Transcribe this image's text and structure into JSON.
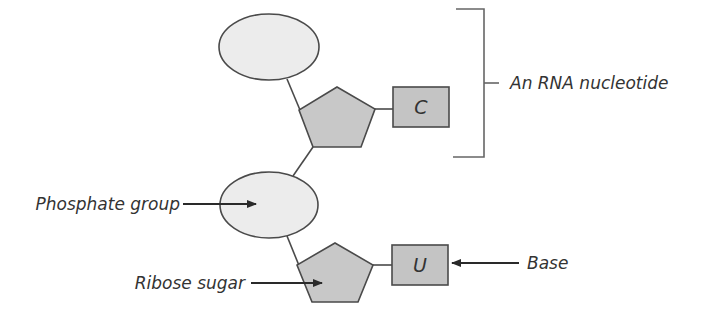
{
  "diagram": {
    "colors": {
      "phosphate_fill": "#ececec",
      "sugar_fill": "#c8c8c8",
      "base_fill": "#c4c4c4",
      "stroke": "#4a4a4a",
      "text": "#333333"
    },
    "nucleotides": [
      {
        "base_letter": "C"
      },
      {
        "base_letter": "U"
      }
    ],
    "labels": {
      "bracket": "An RNA nucleotide",
      "phosphate": "Phosphate group",
      "sugar": "Ribose sugar",
      "base": "Base"
    }
  }
}
